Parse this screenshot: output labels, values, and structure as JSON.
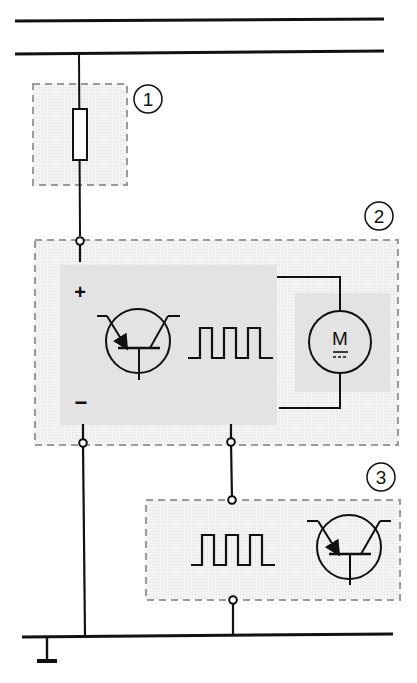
{
  "diagram": {
    "colors": {
      "wire": "#111111",
      "box_border": "#9a9a9a",
      "box_fill": "#eeeeee",
      "inner_fill": "#e2e2e2",
      "background": "#ffffff"
    },
    "rails": {
      "top_rail_1": "supply rail (upper)",
      "top_rail_2": "supply rail (lower)",
      "ground_rail": "ground rail"
    },
    "blocks": [
      {
        "id": 1,
        "label": "1",
        "content": "fuse"
      },
      {
        "id": 2,
        "label": "2",
        "content": "motor control unit: transistor, PWM signal, DC motor"
      },
      {
        "id": 3,
        "label": "3",
        "content": "control module: PWM signal, transistor"
      }
    ],
    "block2": {
      "plus_sign": "+",
      "minus_sign": "−",
      "motor_letter": "M"
    }
  }
}
